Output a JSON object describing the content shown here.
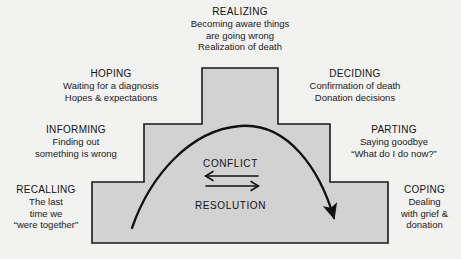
{
  "diagram": {
    "shape_fill": "#d2d2d2",
    "shape_stroke": "#1a1a1a",
    "background": "#f2f2f0",
    "center": {
      "conflict_label": "CONFLICT",
      "resolution_label": "RESOLUTION"
    },
    "stages": [
      {
        "key": "realizing",
        "title": "REALIZING",
        "lines": [
          "Becoming aware things",
          "are going wrong",
          "Realization of death"
        ]
      },
      {
        "key": "hoping",
        "title": "HOPING",
        "lines": [
          "Waiting for a diagnosis",
          "Hopes & expectations"
        ]
      },
      {
        "key": "deciding",
        "title": "DECIDING",
        "lines": [
          "Confirmation of death",
          "Donation decisions"
        ]
      },
      {
        "key": "informing",
        "title": "INFORMING",
        "lines": [
          "Finding out",
          "something is wrong"
        ]
      },
      {
        "key": "parting",
        "title": "PARTING",
        "lines": [
          "Saying goodbye",
          "“What do I do now?”"
        ]
      },
      {
        "key": "recalling",
        "title": "RECALLING",
        "lines": [
          "The last",
          "time we",
          "“were together”"
        ]
      },
      {
        "key": "coping",
        "title": "COPING",
        "lines": [
          "Dealing",
          "with grief &",
          "donation"
        ]
      }
    ]
  }
}
